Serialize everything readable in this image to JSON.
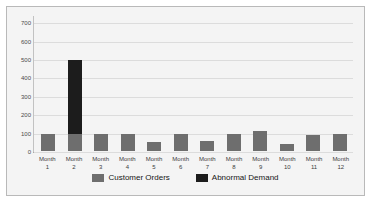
{
  "chart_data": {
    "type": "bar",
    "stacked": true,
    "title": "",
    "xlabel": "",
    "ylabel": "",
    "categories": [
      "Month 1",
      "Month 2",
      "Month 3",
      "Month 4",
      "Month 5",
      "Month 6",
      "Month 7",
      "Month 8",
      "Month 9",
      "Month 10",
      "Month 11",
      "Month 12"
    ],
    "category_lines": [
      {
        "line1": "Month",
        "line2": "1"
      },
      {
        "line1": "Month",
        "line2": "2"
      },
      {
        "line1": "Month",
        "line2": "3"
      },
      {
        "line1": "Month",
        "line2": "4"
      },
      {
        "line1": "Month",
        "line2": "5"
      },
      {
        "line1": "Month",
        "line2": "6"
      },
      {
        "line1": "Month",
        "line2": "7"
      },
      {
        "line1": "Month",
        "line2": "8"
      },
      {
        "line1": "Month",
        "line2": "9"
      },
      {
        "line1": "Month",
        "line2": "10"
      },
      {
        "line1": "Month",
        "line2": "11"
      },
      {
        "line1": "Month",
        "line2": "12"
      }
    ],
    "series": [
      {
        "name": "Customer Orders",
        "color": "#6e6e6e",
        "values": [
          95,
          95,
          90,
          90,
          50,
          90,
          55,
          95,
          110,
          40,
          85,
          90
        ]
      },
      {
        "name": "Abnormal Demand",
        "color": "#1c1c1c",
        "values": [
          0,
          400,
          0,
          0,
          0,
          0,
          0,
          0,
          0,
          0,
          0,
          0
        ]
      }
    ],
    "totals": [
      95,
      495,
      90,
      90,
      50,
      90,
      55,
      95,
      110,
      40,
      85,
      90
    ],
    "ylim": [
      0,
      740
    ],
    "yticks": [
      0,
      100,
      200,
      300,
      400,
      500,
      600,
      700
    ],
    "ytick_labels": [
      "0",
      "100",
      "200",
      "300",
      "400",
      "500",
      "600",
      "700"
    ],
    "grid": true,
    "legend_position": "bottom",
    "legend": [
      {
        "label": "Customer Orders",
        "color": "#6e6e6e"
      },
      {
        "label": "Abnormal Demand",
        "color": "#1c1c1c"
      }
    ]
  }
}
